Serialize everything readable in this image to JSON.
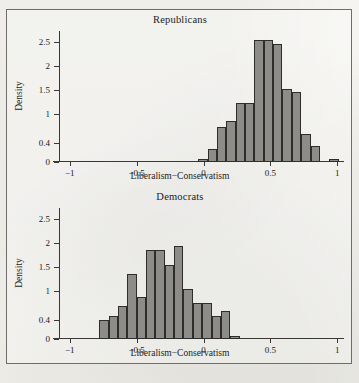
{
  "figure": {
    "xlabel": "Liberalism−Conservatism",
    "ylabel": "Density",
    "xticks": [
      "−1",
      "−0.5",
      "0",
      "0.5",
      "1"
    ],
    "xtick_values": [
      -1,
      -0.5,
      0,
      0.5,
      1
    ],
    "yticks": [
      "0",
      "0.4",
      "1",
      "1.5",
      "2",
      "2.5"
    ],
    "ytick_values": [
      0,
      0.4,
      1,
      1.5,
      2,
      2.5
    ],
    "bar_color": "#8d8c88",
    "bar_edge_color": "#2e2d2b",
    "caption": ""
  },
  "chart_data": [
    {
      "type": "bar",
      "title": "Republicans",
      "xlabel": "Liberalism−Conservatism",
      "ylabel": "Density",
      "xlim": [
        -1.08,
        1.05
      ],
      "ylim": [
        0,
        2.72
      ],
      "grid": false,
      "legend": "none",
      "bin_width": 0.07,
      "bin_starts": [
        -0.04,
        0.03,
        0.1,
        0.17,
        0.24,
        0.31,
        0.38,
        0.45,
        0.52,
        0.59,
        0.66,
        0.73,
        0.8,
        0.94
      ],
      "values": [
        0.07,
        0.27,
        0.73,
        0.86,
        1.22,
        1.22,
        2.53,
        2.53,
        2.45,
        1.52,
        1.45,
        0.58,
        0.34,
        0.06
      ]
    },
    {
      "type": "bar",
      "title": "Democrats",
      "xlabel": "Liberalism−Conservatism",
      "ylabel": "Density",
      "xlim": [
        -1.08,
        1.05
      ],
      "ylim": [
        0,
        2.72
      ],
      "grid": false,
      "legend": "none",
      "bin_width": 0.07,
      "bin_starts": [
        -0.78,
        -0.71,
        -0.64,
        -0.57,
        -0.5,
        -0.43,
        -0.36,
        -0.29,
        -0.22,
        -0.15,
        -0.08,
        -0.01,
        0.06,
        0.13,
        0.2
      ],
      "values": [
        0.4,
        0.47,
        0.68,
        1.36,
        0.88,
        1.85,
        1.85,
        1.53,
        1.93,
        1.04,
        0.75,
        0.75,
        0.47,
        0.58,
        0.06
      ]
    }
  ]
}
